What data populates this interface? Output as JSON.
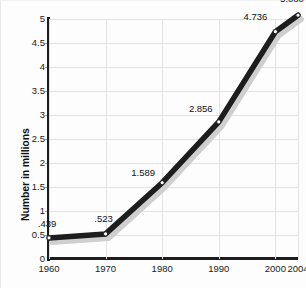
{
  "chart_data": {
    "type": "line",
    "title": "",
    "subtitle": "",
    "xlabel": "",
    "ylabel": "Number in millions",
    "categories": [
      "1960",
      "1970",
      "1980",
      "1990",
      "2000",
      "2004"
    ],
    "x": [
      1960,
      1970,
      1980,
      1990,
      2000,
      2004
    ],
    "values": [
      0.439,
      0.523,
      1.589,
      2.856,
      4.736,
      5.08
    ],
    "point_labels": [
      ".439",
      ".523",
      "1.589",
      "2.856",
      "4.736",
      "5.080"
    ],
    "ylim": [
      0,
      5
    ],
    "xlim": [
      1960,
      2004
    ],
    "y_ticks": [
      0,
      0.5,
      1,
      1.5,
      2,
      2.5,
      3,
      3.5,
      4,
      4.5,
      5
    ],
    "y_tick_labels": [
      "0",
      "0.5",
      "1",
      "1.5",
      "2",
      "2.5",
      "3",
      "3.5",
      "4",
      "4.5",
      "5"
    ],
    "x_tick_labels": [
      "1960",
      "1970",
      "1980",
      "1990",
      "2000",
      "2004"
    ],
    "grid": true,
    "grid_axes": "both",
    "legend": false,
    "legend_position": "none",
    "marker": "circle-open",
    "series": [
      {
        "name": "Number in millions",
        "values": [
          0.439,
          0.523,
          1.589,
          2.856,
          4.736,
          5.08
        ]
      }
    ],
    "colors": {
      "line": "#1d1d1d",
      "line_shadow": "#cfcfcf",
      "marker_fill": "#ffffff",
      "marker_edge": "#1d1d1d",
      "grid": "#e2e2e2",
      "axis": "#1d1d1d",
      "text": "#111111",
      "background": "#fdfdfd"
    }
  }
}
